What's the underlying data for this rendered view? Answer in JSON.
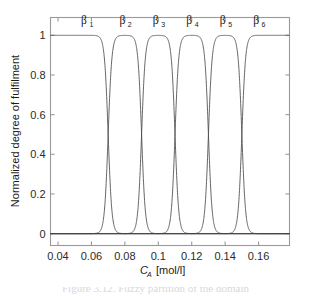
{
  "figure": {
    "background_color": "#ffffff",
    "axis_color": "#9a9a9a",
    "curve_color": "#4a4a4a"
  },
  "caption": {
    "text": "Figure 3.12.   Fuzzy partition of the domain"
  },
  "chart_data": {
    "type": "line",
    "title": "",
    "subtitle": "",
    "xlabel": "C_A  [mol/l]",
    "xlabel_base": "C",
    "xlabel_sub": "A",
    "xlabel_units": "[mol/l]",
    "ylabel": "Normalized degree of  fulfilment",
    "xlim": [
      0.0355,
      0.1785
    ],
    "ylim": [
      -0.06,
      1.09
    ],
    "xticks": [
      0.04,
      0.06,
      0.08,
      0.1,
      0.12,
      0.14,
      0.16
    ],
    "xticklabels": [
      "0.04",
      "0.06",
      "0.08",
      "0.1",
      "0.12",
      "0.14",
      "0.16"
    ],
    "yticks": [
      0,
      0.2,
      0.4,
      0.6,
      0.8,
      1
    ],
    "yticklabels": [
      "0",
      "0.2",
      "0.4",
      "0.6",
      "0.8",
      "1"
    ],
    "grid": false,
    "legend_position": "none",
    "annotations": [
      {
        "text": "β1",
        "base": "β",
        "sub": "1",
        "x": 0.0555,
        "y": 1.055
      },
      {
        "text": "β2",
        "base": "β",
        "sub": "2",
        "x": 0.0785,
        "y": 1.055
      },
      {
        "text": "β3",
        "base": "β",
        "sub": "3",
        "x": 0.0985,
        "y": 1.055
      },
      {
        "text": "β4",
        "base": "β",
        "sub": "4",
        "x": 0.1185,
        "y": 1.055
      },
      {
        "text": "β5",
        "base": "β",
        "sub": "5",
        "x": 0.1385,
        "y": 1.055
      },
      {
        "text": "β6",
        "base": "β",
        "sub": "6",
        "x": 0.1585,
        "y": 1.055
      }
    ],
    "series": [
      {
        "name": "β1",
        "left_edge": null,
        "right_edge": 0.07,
        "steepness": 900,
        "plateau": [
          0.0355,
          0.0665
        ]
      },
      {
        "name": "β2",
        "left_edge": 0.07,
        "right_edge": 0.09,
        "steepness": 900,
        "plateau": [
          0.0735,
          0.0865
        ]
      },
      {
        "name": "β3",
        "left_edge": 0.09,
        "right_edge": 0.11,
        "steepness": 900,
        "plateau": [
          0.0935,
          0.1065
        ]
      },
      {
        "name": "β4",
        "left_edge": 0.11,
        "right_edge": 0.13,
        "steepness": 900,
        "plateau": [
          0.1135,
          0.1265
        ]
      },
      {
        "name": "β5",
        "left_edge": 0.13,
        "right_edge": 0.15,
        "steepness": 900,
        "plateau": [
          0.1335,
          0.1465
        ]
      },
      {
        "name": "β6",
        "left_edge": 0.15,
        "right_edge": null,
        "steepness": 900,
        "plateau": [
          0.1535,
          0.1785
        ]
      }
    ],
    "crossover_points": [
      0.07,
      0.09,
      0.11,
      0.13,
      0.15
    ],
    "crossover_value": 0.5,
    "num_membership_functions": 6
  }
}
